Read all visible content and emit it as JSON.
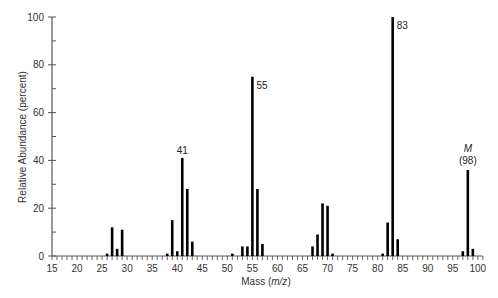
{
  "chart_data": {
    "type": "bar",
    "title": "",
    "xlabel": "Mass (m/z)",
    "xlabel_parts": {
      "prefix": "Mass (",
      "italic": "m/z",
      "suffix": ")"
    },
    "ylabel": "Relative Abundance (percent)",
    "xlim": [
      15,
      101
    ],
    "ylim": [
      0,
      100
    ],
    "x_major_ticks": [
      15,
      20,
      25,
      30,
      35,
      40,
      45,
      50,
      55,
      60,
      65,
      70,
      75,
      80,
      85,
      90,
      95,
      100
    ],
    "x_minor_step": 1,
    "y_major_ticks": [
      0,
      20,
      40,
      60,
      80,
      100
    ],
    "y_minor_ticks": [
      10,
      30,
      50,
      70,
      90
    ],
    "grid": false,
    "legend": null,
    "x": [
      26,
      27,
      28,
      29,
      38,
      39,
      40,
      41,
      42,
      43,
      51,
      53,
      54,
      55,
      56,
      57,
      67,
      68,
      69,
      70,
      71,
      81,
      82,
      83,
      84,
      97,
      98,
      99
    ],
    "values": [
      1,
      12,
      3,
      11,
      1,
      15,
      2,
      41,
      28,
      6,
      1,
      4,
      4,
      75,
      28,
      5,
      4,
      9,
      22,
      21,
      1,
      1,
      14,
      100,
      7,
      2,
      36,
      3
    ],
    "annotations": [
      {
        "x": 41,
        "text": "41",
        "position": "above"
      },
      {
        "x": 55,
        "text": "55",
        "position": "right"
      },
      {
        "x": 83,
        "text": "83",
        "position": "right"
      },
      {
        "x": 98,
        "text": "M",
        "text2": "(98)",
        "position": "above",
        "italic_first": true
      }
    ],
    "bar_color": "#000000",
    "axis_color": "#555555"
  }
}
